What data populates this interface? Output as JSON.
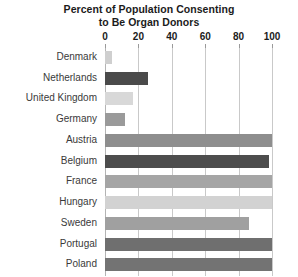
{
  "chart_data": {
    "type": "bar",
    "orientation": "horizontal",
    "title": "Percent of Population Consenting to Be Organ Donors",
    "title_lines": [
      "Percent of Population Consenting",
      "to Be Organ Donors"
    ],
    "xlabel": "",
    "ylabel": "",
    "xlim": [
      0,
      100
    ],
    "xticks": [
      0,
      20,
      40,
      60,
      80,
      100
    ],
    "xtick_labels": [
      "0",
      "20",
      "40",
      "60",
      "80",
      "100"
    ],
    "grid": true,
    "grid_axis": "x",
    "legend": false,
    "axis_position": "top",
    "categories": [
      "Denmark",
      "Netherlands",
      "United Kingdom",
      "Germany",
      "Austria",
      "Belgium",
      "France",
      "Hungary",
      "Sweden",
      "Portugal",
      "Poland"
    ],
    "values": [
      4,
      26,
      17,
      12,
      100,
      98,
      100,
      100,
      86,
      100,
      100
    ],
    "bar_colors": [
      "#cfcfcf",
      "#4a4a4a",
      "#d8d8d8",
      "#9a9a9a",
      "#8e8e8e",
      "#4d4d4d",
      "#a5a5a5",
      "#d2d2d2",
      "#a0a0a0",
      "#6f6f6f",
      "#737373"
    ],
    "colors": {
      "background": "#ffffff",
      "text": "#1b1b1b",
      "label_text": "#3a3a3a",
      "gridline": "#c9c9c9",
      "axis_line": "#b4b4b4"
    }
  }
}
